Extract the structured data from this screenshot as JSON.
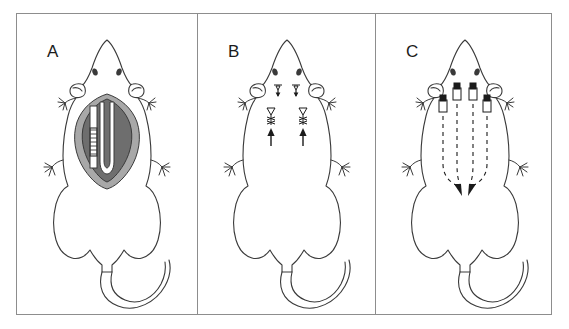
{
  "figure": {
    "background_color": "#ffffff",
    "frame_color": "#8d8d8d",
    "outline_color": "#3a3a3a",
    "panel_count": 3
  },
  "panels": [
    {
      "id": "panel-a",
      "label": "A",
      "description": "Dorsal view of rat with open surgical wound on the back showing exposed cavity and graduated measuring probe",
      "features": {
        "wound_outer_fill": "#a8a8a8",
        "wound_inner_fill": "#6e6e6e",
        "wound_channel_fill": "#ffffff",
        "probe_label": "graduated-probe",
        "probe_tick_count": 7,
        "markers": []
      }
    },
    {
      "id": "panel-b",
      "label": "B",
      "description": "Dorsal view of rat with two closed sutured incisions on the upper back marked by arrows",
      "features": {
        "incision_count": 2,
        "suture_marks_per_incision": 3,
        "arrow_count": 2,
        "neck_marker_count": 2,
        "arrow_color": "#1b1b1b",
        "markers": [
          "suture-site-left",
          "suture-site-right"
        ]
      }
    },
    {
      "id": "panel-c",
      "label": "C",
      "description": "Dorsal view of rat with four implanted ports connected by dashed subcutaneous tunnels converging to two arrowheads",
      "features": {
        "implant_count": 4,
        "dashed_track_count": 4,
        "arrowhead_count": 2,
        "implant_cap_color": "#1b1b1b",
        "implant_body_fill": "#ffffff",
        "track_style": "dashed",
        "markers": [
          "implant-1",
          "implant-2",
          "implant-3",
          "implant-4"
        ]
      }
    }
  ]
}
